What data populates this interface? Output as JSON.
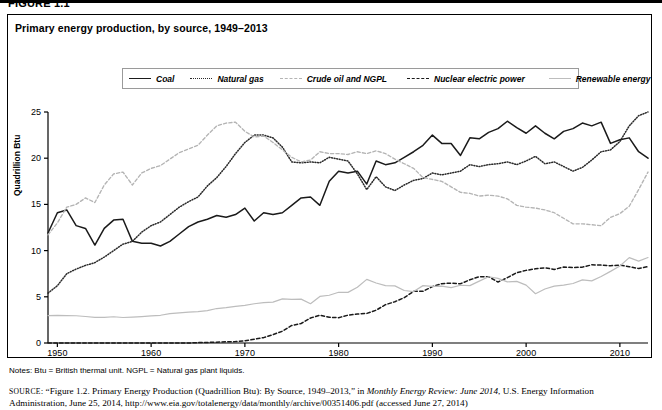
{
  "figure_label": "FIGURE 1.1",
  "chart_title": "Primary energy production, by source, 1949–2013",
  "notes": "Notes: Btu = British thermal unit. NGPL = Natural gas plant liquids.",
  "source": {
    "prefix": "SOURCE",
    "text_1": ": “Figure 1.2. Primary Energy Production (Quadrillion Btu): By Source, 1949–2013,” in ",
    "italic_1": "Monthly Energy Review: June 2014",
    "text_2": ", U.S. Energy Information Administration, June 25, 2014, http://www.eia.gov/totalenergy/data/monthly/archive/00351406.pdf (accessed June 27, 2014)"
  },
  "legend": {
    "items": [
      {
        "label": "Coal",
        "style": "solid",
        "color": "#1a1a1a"
      },
      {
        "label": "Natural gas",
        "style": "dotted",
        "color": "#2a2a2a"
      },
      {
        "label": "Crude oil and NGPL",
        "style": "dashed-gray",
        "color": "#b4b4b4"
      },
      {
        "label": "Nuclear electric power",
        "style": "dashed",
        "color": "#1a1a1a"
      },
      {
        "label": "Renewable energy",
        "style": "solid-gray",
        "color": "#bdbdbd"
      }
    ]
  },
  "chart_data": {
    "type": "line",
    "title": "Primary energy production, by source, 1949–2013",
    "xlabel": "",
    "ylabel": "Quadrillion Btu",
    "xlim": [
      1949,
      2013
    ],
    "ylim": [
      0,
      25
    ],
    "yticks": [
      0,
      5,
      10,
      15,
      20,
      25
    ],
    "xticks": [
      1950,
      1960,
      1970,
      1980,
      1990,
      2000,
      2010
    ],
    "grid": false,
    "legend_position": "top",
    "x": [
      1949,
      1950,
      1951,
      1952,
      1953,
      1954,
      1955,
      1956,
      1957,
      1958,
      1959,
      1960,
      1961,
      1962,
      1963,
      1964,
      1965,
      1966,
      1967,
      1968,
      1969,
      1970,
      1971,
      1972,
      1973,
      1974,
      1975,
      1976,
      1977,
      1978,
      1979,
      1980,
      1981,
      1982,
      1983,
      1984,
      1985,
      1986,
      1987,
      1988,
      1989,
      1990,
      1991,
      1992,
      1993,
      1994,
      1995,
      1996,
      1997,
      1998,
      1999,
      2000,
      2001,
      2002,
      2003,
      2004,
      2005,
      2006,
      2007,
      2008,
      2009,
      2010,
      2011,
      2012,
      2013
    ],
    "series": [
      {
        "name": "Coal",
        "style": "solid",
        "color": "#1a1a1a",
        "values": [
          11.9,
          14.1,
          14.4,
          12.7,
          12.4,
          10.6,
          12.4,
          13.3,
          13.4,
          11.0,
          10.8,
          10.8,
          10.5,
          11.0,
          11.8,
          12.6,
          13.1,
          13.4,
          13.8,
          13.6,
          13.9,
          14.6,
          13.2,
          14.1,
          13.9,
          14.1,
          14.9,
          15.7,
          15.8,
          14.9,
          17.5,
          18.6,
          18.4,
          18.6,
          17.2,
          19.7,
          19.3,
          19.5,
          20.1,
          20.7,
          21.4,
          22.5,
          21.6,
          21.6,
          20.3,
          22.2,
          22.1,
          22.8,
          23.2,
          24.0,
          23.3,
          22.7,
          23.5,
          22.7,
          22.1,
          22.9,
          23.2,
          23.8,
          23.5,
          23.9,
          21.6,
          22.0,
          22.2,
          20.7,
          20.0
        ]
      },
      {
        "name": "Natural gas",
        "style": "dotted",
        "color": "#2a2a2a",
        "values": [
          5.4,
          6.2,
          7.5,
          8.0,
          8.4,
          8.7,
          9.3,
          10.0,
          10.7,
          11.0,
          12.0,
          12.7,
          13.1,
          13.9,
          14.7,
          15.3,
          15.8,
          17.0,
          17.9,
          19.1,
          20.5,
          21.7,
          22.5,
          22.5,
          22.2,
          21.2,
          19.6,
          19.5,
          19.6,
          19.5,
          20.1,
          19.9,
          19.7,
          18.3,
          16.6,
          18.0,
          16.9,
          16.5,
          17.1,
          17.6,
          17.8,
          18.4,
          18.2,
          18.4,
          18.6,
          19.3,
          19.1,
          19.3,
          19.4,
          19.6,
          19.3,
          19.7,
          20.2,
          19.4,
          19.6,
          19.1,
          18.6,
          19.0,
          19.8,
          20.7,
          20.9,
          21.8,
          23.5,
          24.6,
          25.0
        ]
      },
      {
        "name": "Crude oil and NGPL",
        "style": "dashed-gray",
        "color": "#b4b4b4",
        "values": [
          11.7,
          13.0,
          14.7,
          15.0,
          15.7,
          15.2,
          17.1,
          18.3,
          18.5,
          17.1,
          18.4,
          18.9,
          19.2,
          19.9,
          20.6,
          21.0,
          21.4,
          22.5,
          23.5,
          23.8,
          23.9,
          22.9,
          22.3,
          22.4,
          21.7,
          20.9,
          20.1,
          19.6,
          19.8,
          20.7,
          20.5,
          20.5,
          20.4,
          20.7,
          20.5,
          20.8,
          20.5,
          19.9,
          19.4,
          18.9,
          17.9,
          17.7,
          17.5,
          16.9,
          16.3,
          16.2,
          15.9,
          16.0,
          15.9,
          15.6,
          14.9,
          14.7,
          14.6,
          14.4,
          14.1,
          13.5,
          12.9,
          12.9,
          12.8,
          12.7,
          13.6,
          14.0,
          14.8,
          16.6,
          18.5
        ]
      },
      {
        "name": "Nuclear electric power",
        "style": "dashed",
        "color": "#1a1a1a",
        "values": [
          0.0,
          0.0,
          0.0,
          0.0,
          0.0,
          0.0,
          0.0,
          0.0,
          0.0,
          0.0,
          0.0,
          0.0,
          0.0,
          0.0,
          0.0,
          0.0,
          0.04,
          0.06,
          0.09,
          0.14,
          0.15,
          0.24,
          0.41,
          0.58,
          0.91,
          1.27,
          1.9,
          2.11,
          2.7,
          3.02,
          2.78,
          2.74,
          3.01,
          3.13,
          3.2,
          3.55,
          4.15,
          4.47,
          4.91,
          5.59,
          5.6,
          6.1,
          6.42,
          6.48,
          6.41,
          6.84,
          7.18,
          7.17,
          6.6,
          7.07,
          7.61,
          7.86,
          8.03,
          8.14,
          7.96,
          8.22,
          8.16,
          8.21,
          8.46,
          8.43,
          8.36,
          8.43,
          8.26,
          8.06,
          8.27
        ]
      },
      {
        "name": "Renewable energy",
        "style": "solid-gray",
        "color": "#bdbdbd",
        "values": [
          2.97,
          2.98,
          2.96,
          2.95,
          2.87,
          2.78,
          2.78,
          2.84,
          2.76,
          2.8,
          2.86,
          2.93,
          3.0,
          3.18,
          3.25,
          3.34,
          3.4,
          3.5,
          3.73,
          3.82,
          3.96,
          4.08,
          4.25,
          4.36,
          4.43,
          4.77,
          4.72,
          4.75,
          4.25,
          5.04,
          5.17,
          5.49,
          5.48,
          6.03,
          6.89,
          6.49,
          6.21,
          6.18,
          5.68,
          5.57,
          6.21,
          6.13,
          6.15,
          6.0,
          6.25,
          6.21,
          6.7,
          7.17,
          7.0,
          6.61,
          6.67,
          6.26,
          5.33,
          5.84,
          6.15,
          6.26,
          6.44,
          6.83,
          6.72,
          7.19,
          7.75,
          8.34,
          9.24,
          8.86,
          9.25
        ]
      }
    ]
  }
}
